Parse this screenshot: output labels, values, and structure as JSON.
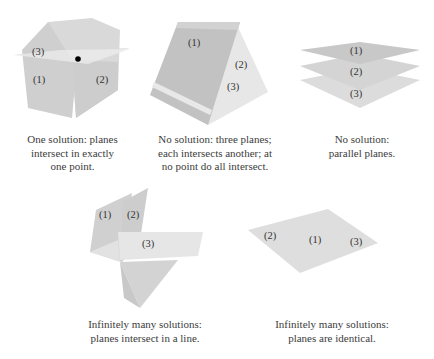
{
  "figure": {
    "panels": [
      {
        "id": "one-solution",
        "labels": [
          "(1)",
          "(2)",
          "(3)"
        ],
        "caption": [
          "One solution: planes",
          "intersect in exactly",
          "one point."
        ]
      },
      {
        "id": "no-solution-tent",
        "labels": [
          "(1)",
          "(2)",
          "(3)"
        ],
        "caption": [
          "No solution: three planes;",
          "each intersects another; at",
          "no point do all intersect."
        ]
      },
      {
        "id": "no-solution-parallel",
        "labels": [
          "(1)",
          "(2)",
          "(3)"
        ],
        "caption": [
          "No solution:",
          "parallel planes."
        ]
      },
      {
        "id": "infinite-line",
        "labels": [
          "(1)",
          "(2)",
          "(3)"
        ],
        "caption": [
          "Infinitely many solutions:",
          "planes intersect in a line."
        ]
      },
      {
        "id": "infinite-identical",
        "labels": [
          "(2)",
          "(1)",
          "(3)"
        ],
        "caption": [
          "Infinitely many solutions:",
          "planes are identical."
        ]
      }
    ],
    "colors": {
      "plane_dark": "#c4c4c4",
      "plane_mid": "#d6d6d6",
      "plane_light": "#e6e6e6",
      "point": "#000000",
      "text": "#3a3a3a"
    }
  }
}
